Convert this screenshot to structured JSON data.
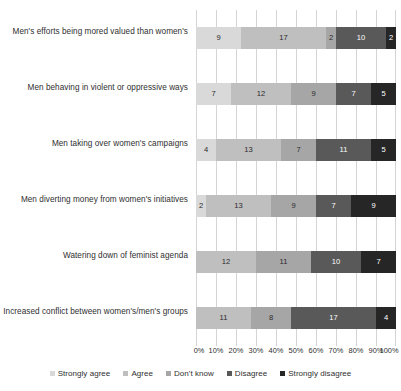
{
  "top_caption": "",
  "chart_data": {
    "type": "bar",
    "orientation": "horizontal",
    "stacked": true,
    "stack_mode": "100%",
    "title": "",
    "subtitle": "",
    "xlabel": "",
    "ylabel": "",
    "grid": true,
    "legend_position": "bottom",
    "xlim": [
      0,
      100
    ],
    "xticks": [
      "0%",
      "10%",
      "20%",
      "30%",
      "40%",
      "50%",
      "60%",
      "70%",
      "80%",
      "90%",
      "100%"
    ],
    "xtick_values": [
      0,
      10,
      20,
      30,
      40,
      50,
      60,
      70,
      80,
      90,
      100
    ],
    "row_total": 40,
    "categories": [
      "Men's efforts being mored valued than women's",
      "Men behaving in violent or oppressive ways",
      "Men taking over women's campaigns",
      "Men diverting money from women's initiatives",
      "Watering down of feminist agenda",
      "Increased conflict between women's/men's groups"
    ],
    "series": [
      {
        "name": "Strongly agree",
        "color": "#d9d9d9",
        "values": [
          9,
          7,
          4,
          2,
          0,
          0
        ]
      },
      {
        "name": "Agree",
        "color": "#bfbfbf",
        "values": [
          17,
          12,
          13,
          13,
          12,
          11
        ]
      },
      {
        "name": "Don't know",
        "color": "#a6a6a6",
        "values": [
          2,
          9,
          7,
          9,
          11,
          8
        ]
      },
      {
        "name": "Disagree",
        "color": "#595959",
        "values": [
          10,
          7,
          11,
          7,
          10,
          17
        ]
      },
      {
        "name": "Strongly disagree",
        "color": "#262626",
        "values": [
          2,
          5,
          5,
          9,
          7,
          4
        ]
      }
    ]
  },
  "legend": {
    "items": [
      {
        "label": "Strongly agree"
      },
      {
        "label": "Agree"
      },
      {
        "label": "Don't know"
      },
      {
        "label": "Disagree"
      },
      {
        "label": "Strongly disagree"
      }
    ]
  }
}
